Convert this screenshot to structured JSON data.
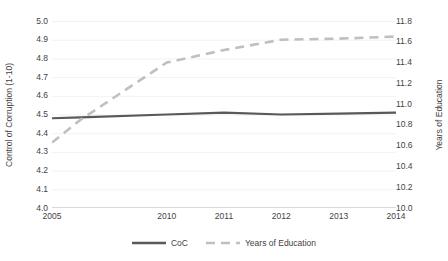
{
  "chart_data": {
    "type": "line",
    "title": "",
    "xlabel": "",
    "categories": [
      "2005",
      "2010",
      "2011",
      "2012",
      "2013",
      "2014"
    ],
    "x_positions": [
      0,
      2,
      3,
      4,
      5,
      6
    ],
    "grid": true,
    "legend_position": "bottom",
    "axes": {
      "left": {
        "label": "Control of Corruption (1-10)",
        "ylim": [
          4.0,
          5.0
        ],
        "tick_step": 0.1,
        "ticks": [
          "5.0",
          "4.9",
          "4.8",
          "4.7",
          "4.6",
          "4.5",
          "4.4",
          "4.3",
          "4.2",
          "4.1",
          "4.0"
        ],
        "tick_values": [
          5.0,
          4.9,
          4.8,
          4.7,
          4.6,
          4.5,
          4.4,
          4.3,
          4.2,
          4.1,
          4.0
        ]
      },
      "right": {
        "label": "Years of Education",
        "ylim": [
          10.0,
          11.8
        ],
        "tick_step": 0.2,
        "ticks": [
          "11.8",
          "11.6",
          "11.4",
          "11.2",
          "11.0",
          "10.8",
          "10.6",
          "10.4",
          "10.2",
          "10.0"
        ],
        "tick_values": [
          11.8,
          11.6,
          11.4,
          11.2,
          11.0,
          10.8,
          10.6,
          10.4,
          10.2,
          10.0
        ]
      }
    },
    "series": [
      {
        "name": "CoC",
        "axis": "left",
        "style": "solid",
        "color": "#595959",
        "width": 2.2,
        "x": [
          0,
          0.5,
          2,
          3,
          4,
          5,
          6
        ],
        "values": [
          4.48,
          4.485,
          4.5,
          4.51,
          4.5,
          4.505,
          4.51
        ]
      },
      {
        "name": "Years of Education",
        "axis": "right",
        "style": "dashed",
        "color": "#bfbfbf",
        "width": 2.6,
        "x": [
          0,
          0.5,
          2,
          3,
          4,
          5,
          6
        ],
        "values": [
          10.63,
          10.85,
          11.4,
          11.52,
          11.62,
          11.63,
          11.65
        ]
      }
    ]
  },
  "legend": {
    "entries": [
      {
        "label": "CoC",
        "style": "solid",
        "color": "#595959"
      },
      {
        "label": "Years of Education",
        "style": "dashed",
        "color": "#bfbfbf"
      }
    ]
  },
  "colors": {
    "coc_line": "#595959",
    "education_line": "#bfbfbf",
    "grid": "#f2f2f2",
    "axis_line": "#d9d9d9",
    "text": "#3f3f3f",
    "background": "#ffffff"
  }
}
